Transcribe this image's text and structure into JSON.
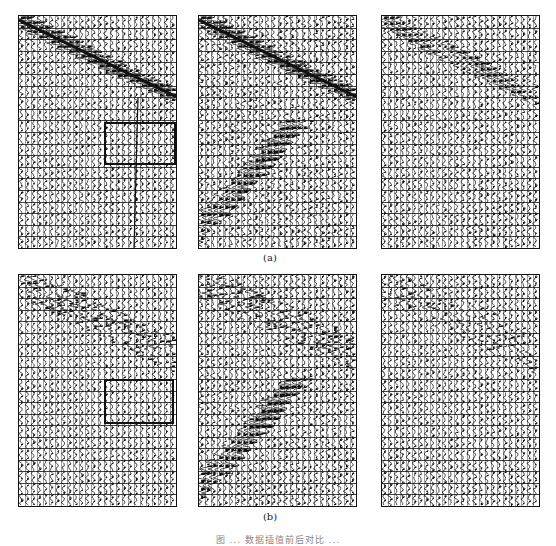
{
  "figure": {
    "rows": [
      {
        "label": "(a)",
        "panels": [
          {
            "id": "a1",
            "x": 18,
            "y": 15,
            "w": 159,
            "h": 234,
            "event": "strong",
            "noise": 0.35,
            "seed": 11,
            "highlight": {
              "x": 104,
              "y": 122,
              "w": 72,
              "h": 43
            },
            "vertical_line_x": 137
          },
          {
            "id": "a2",
            "x": 198,
            "y": 15,
            "w": 159,
            "h": 234,
            "event": "strong",
            "noise": 0.55,
            "seed": 23,
            "diag_lowleft": true
          },
          {
            "id": "a3",
            "x": 381,
            "y": 15,
            "w": 159,
            "h": 234,
            "event": "medium",
            "noise": 0.45,
            "seed": 37
          }
        ]
      },
      {
        "label": "(b)",
        "panels": [
          {
            "id": "b1",
            "x": 18,
            "y": 274,
            "w": 159,
            "h": 233,
            "event": "scattered",
            "noise": 0.3,
            "seed": 41,
            "highlight": {
              "x": 104,
              "y": 379,
              "w": 70,
              "h": 45
            }
          },
          {
            "id": "b2",
            "x": 198,
            "y": 274,
            "w": 159,
            "h": 233,
            "event": "scattered",
            "noise": 0.5,
            "seed": 53,
            "diag_lowleft": true
          },
          {
            "id": "b3",
            "x": 381,
            "y": 274,
            "w": 159,
            "h": 233,
            "event": "faint",
            "noise": 0.4,
            "seed": 67
          }
        ]
      }
    ],
    "sublabels": {
      "a": "(a)",
      "b": "(b)"
    },
    "caption": "图 ... 数据插值前后对比 ..."
  },
  "style": {
    "ink": "#111111",
    "trace_count": 26,
    "row_count": 20
  }
}
